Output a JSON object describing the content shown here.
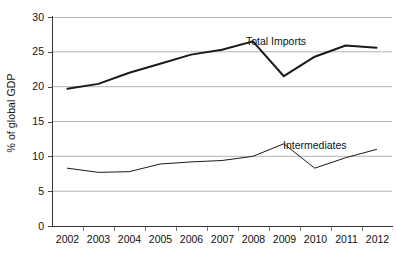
{
  "chart": {
    "ylabel": "% of global GDP",
    "xlabel": "",
    "title": ""
  },
  "chart_data": {
    "type": "line",
    "title": "",
    "xlabel": "",
    "ylabel": "% of global GDP",
    "categories": [
      "2002",
      "2003",
      "2004",
      "2005",
      "2006",
      "2007",
      "2008",
      "2009",
      "2010",
      "2011",
      "2012"
    ],
    "x": [
      2002,
      2003,
      2004,
      2005,
      2006,
      2007,
      2008,
      2009,
      2010,
      2011,
      2012
    ],
    "ylim": [
      0,
      30
    ],
    "yticks": [
      0,
      5,
      10,
      15,
      20,
      25,
      30
    ],
    "grid": "horizontal",
    "legend_position": "inline-annotation",
    "series": [
      {
        "name": "Total Imports",
        "values": [
          19.7,
          20.4,
          22.0,
          23.3,
          24.6,
          25.3,
          26.5,
          21.5,
          24.3,
          25.9,
          25.6
        ],
        "color": "#1a1a1a",
        "line_width": 2.0,
        "annotation": "Total Imports"
      },
      {
        "name": "Intermediates",
        "values": [
          8.3,
          7.7,
          7.8,
          8.9,
          9.2,
          9.4,
          10.0,
          11.8,
          8.3,
          9.8,
          11.0
        ],
        "color": "#1a1a1a",
        "line_width": 1.0,
        "annotation": "Intermediates"
      }
    ],
    "annotations": [
      {
        "text": "Total Imports",
        "near_x": 2008,
        "near_y": 26.5
      },
      {
        "text": "Intermediates",
        "near_x": 2010,
        "near_y": 12.0
      }
    ]
  },
  "axes": {
    "y_tick_labels": [
      "30",
      "25",
      "20",
      "15",
      "10",
      "5",
      "0"
    ],
    "x_tick_labels": [
      "2002",
      "2003",
      "2004",
      "2005",
      "2006",
      "2007",
      "2008",
      "2009",
      "2010",
      "2011",
      "2012"
    ]
  },
  "colors": {
    "line": "#1a1a1a",
    "gridline": "#b3b3b3",
    "axis": "#333333",
    "background": "#ffffff",
    "text": "#111111"
  }
}
